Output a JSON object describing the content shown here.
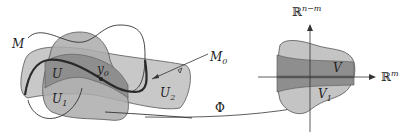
{
  "diagram": {
    "type": "submanifold-chart-illustration",
    "labels": {
      "M": "M",
      "M0": "M",
      "M0_sub": "0",
      "U": "U",
      "U1": "U",
      "U1_sub": "1",
      "U2": "U",
      "U2_sub": "2",
      "y0": "y",
      "y0_sub": "0",
      "Phi": "Φ",
      "V": "V",
      "V1": "V",
      "V1_sub": "1",
      "Rnm": "ℝ",
      "Rnm_sup": "n−m",
      "Rm": "ℝ",
      "Rm_sup": "m"
    },
    "colors": {
      "light_region": "#c4c4c4",
      "mid_region": "#a8a8a8",
      "dark_region": "#8e8e8e",
      "stroke": "#333333",
      "thick_curve": "#2a2a2a",
      "axis_band": "#555555"
    }
  }
}
